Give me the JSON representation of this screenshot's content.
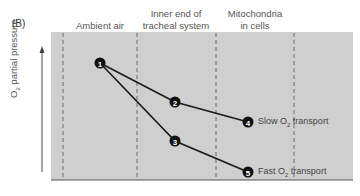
{
  "panel": "(B)",
  "columns": [
    {
      "label_line1": "Ambient air",
      "label_line2": ""
    },
    {
      "label_line1": "Inner end of",
      "label_line2": "tracheal system"
    },
    {
      "label_line1": "Mitochondria",
      "label_line2": "in cells"
    }
  ],
  "y_axis": {
    "label_prefix": "O",
    "label_sub": "2",
    "label_suffix": " partial pressure"
  },
  "nodes": [
    {
      "id": "1",
      "x": 100,
      "y": 63
    },
    {
      "id": "2",
      "x": 175,
      "y": 102
    },
    {
      "id": "3",
      "x": 175,
      "y": 141
    },
    {
      "id": "4",
      "x": 248,
      "y": 122
    },
    {
      "id": "5",
      "x": 248,
      "y": 172
    }
  ],
  "series": [
    {
      "name": "slow",
      "label_prefix": "Slow O",
      "label_sub": "2",
      "label_suffix": " transport"
    },
    {
      "name": "fast",
      "label_prefix": "Fast O",
      "label_sub": "2",
      "label_suffix": " transport"
    }
  ],
  "colors": {
    "plot_bg": "#cfcfcf",
    "line": "#1a1a1a",
    "dash": "#6a6a6a"
  }
}
